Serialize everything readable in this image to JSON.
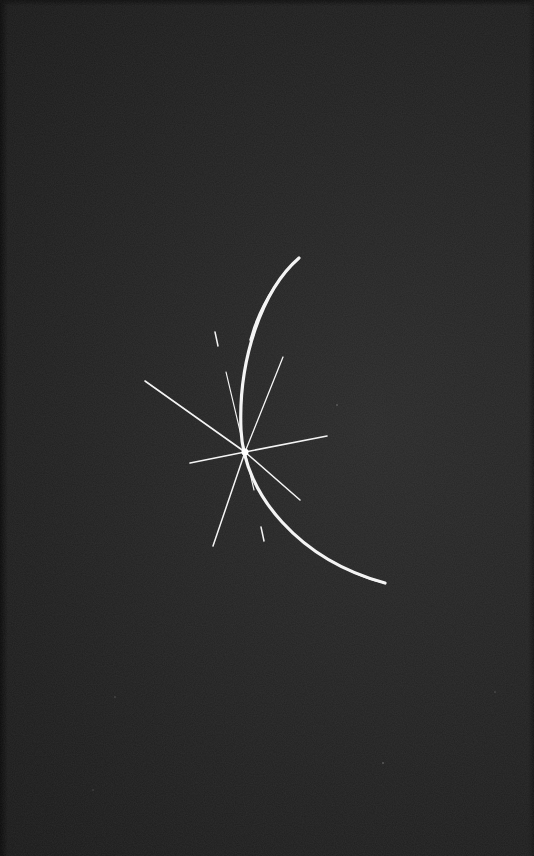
{
  "image": {
    "description": "Dark textured background with a thin white crescent arc crossed by a starburst of light rays",
    "background_color": "#232323",
    "foreground_color": "#f4f4f4",
    "elements": {
      "crescent": {
        "start": [
          299,
          258
        ],
        "control": [
          200,
          430
        ],
        "end": [
          385,
          583
        ]
      },
      "starburst_center": [
        245,
        452
      ],
      "rays": [
        {
          "name": "upper-left",
          "to": [
            145,
            381
          ]
        },
        {
          "name": "left",
          "to": [
            190,
            463
          ]
        },
        {
          "name": "right",
          "to": [
            327,
            436
          ]
        },
        {
          "name": "lower-left",
          "to": [
            213,
            546
          ]
        },
        {
          "name": "lower-right",
          "to": [
            300,
            500
          ]
        },
        {
          "name": "upper-right",
          "to": [
            283,
            357
          ]
        },
        {
          "name": "up",
          "to": [
            226,
            372
          ]
        },
        {
          "name": "down-short",
          "to": [
            254,
            490
          ]
        }
      ],
      "dashes": [
        {
          "from": [
            215,
            332
          ],
          "to": [
            218,
            346
          ]
        },
        {
          "from": [
            261,
            527
          ],
          "to": [
            264,
            541
          ]
        }
      ]
    }
  }
}
